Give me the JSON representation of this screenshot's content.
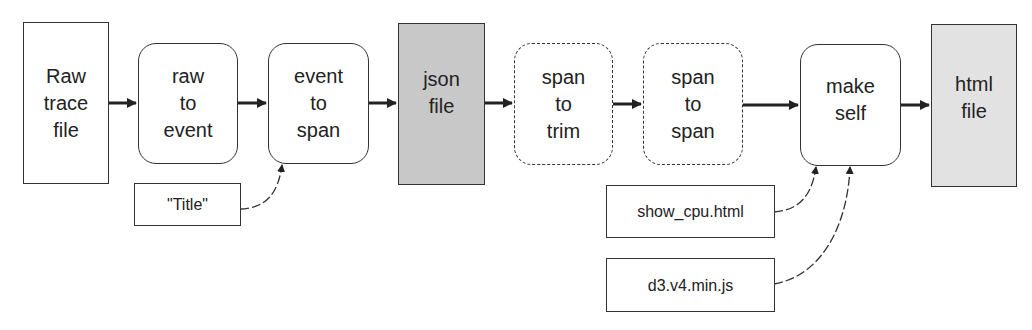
{
  "diagram": {
    "nodes": [
      {
        "id": "raw_trace_file",
        "label": "Raw\ntrace\nfile",
        "kind": "file",
        "fill": "#ffffff"
      },
      {
        "id": "raw_to_event",
        "label": "raw\nto\nevent",
        "kind": "process",
        "fill": "#ffffff"
      },
      {
        "id": "event_to_span",
        "label": "event\nto\nspan",
        "kind": "process",
        "fill": "#ffffff"
      },
      {
        "id": "json_file",
        "label": "json\nfile",
        "kind": "file",
        "fill": "#c8c8c8"
      },
      {
        "id": "span_to_trim",
        "label": "span\nto\ntrim",
        "kind": "optional-process",
        "fill": "#ffffff"
      },
      {
        "id": "span_to_span",
        "label": "span\nto\nspan",
        "kind": "optional-process",
        "fill": "#ffffff"
      },
      {
        "id": "make_self",
        "label": "make\nself",
        "kind": "process",
        "fill": "#ffffff"
      },
      {
        "id": "html_file",
        "label": "html\nfile",
        "kind": "file",
        "fill": "#e2e2e2"
      }
    ],
    "inputs": [
      {
        "id": "title",
        "label": "\"Title\"",
        "target": "event_to_span"
      },
      {
        "id": "show_cpu",
        "label": "show_cpu.html",
        "target": "make_self"
      },
      {
        "id": "d3",
        "label": "d3.v4.min.js",
        "target": "make_self"
      }
    ],
    "edges": [
      [
        "raw_trace_file",
        "raw_to_event"
      ],
      [
        "raw_to_event",
        "event_to_span"
      ],
      [
        "event_to_span",
        "json_file"
      ],
      [
        "json_file",
        "span_to_trim"
      ],
      [
        "span_to_trim",
        "span_to_span"
      ],
      [
        "span_to_span",
        "make_self"
      ],
      [
        "make_self",
        "html_file"
      ],
      [
        "title",
        "event_to_span"
      ],
      [
        "show_cpu",
        "make_self"
      ],
      [
        "d3",
        "make_self"
      ]
    ],
    "colors": {
      "stroke": "#333333",
      "json_fill": "#c8c8c8",
      "html_fill": "#e2e2e2"
    }
  }
}
